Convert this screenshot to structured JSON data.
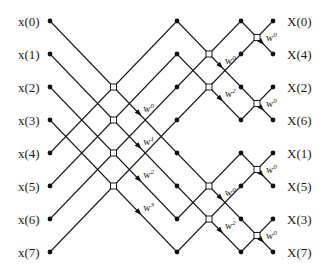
{
  "colors": {
    "line": "#1a1a1a",
    "node": "#111111",
    "background": "#ffffff"
  },
  "inputs": [
    "x(0)",
    "x(1)",
    "x(2)",
    "x(3)",
    "x(4)",
    "x(5)",
    "x(6)",
    "x(7)"
  ],
  "outputs": [
    "X(0)",
    "X(4)",
    "X(2)",
    "X(6)",
    "X(1)",
    "X(5)",
    "X(3)",
    "X(7)"
  ],
  "layout": {
    "row_y": [
      21,
      54,
      87,
      120,
      153,
      186,
      219,
      252
    ],
    "input_label_x": 18,
    "output_label_x": 287,
    "stage_x": [
      50,
      177,
      241,
      273
    ]
  },
  "stages": [
    {
      "name": "stage-1",
      "span": 4,
      "groups": [
        [
          0,
          4
        ],
        [
          1,
          5
        ],
        [
          2,
          6
        ],
        [
          3,
          7
        ]
      ],
      "twiddles": [
        {
          "base": "W",
          "exp": "0"
        },
        {
          "base": "W",
          "exp": "1"
        },
        {
          "base": "W",
          "exp": "2"
        },
        {
          "base": "W",
          "exp": "3"
        }
      ]
    },
    {
      "name": "stage-2",
      "span": 2,
      "groups": [
        [
          0,
          2
        ],
        [
          1,
          3
        ],
        [
          4,
          6
        ],
        [
          5,
          7
        ]
      ],
      "twiddles": [
        {
          "base": "W",
          "exp": "0"
        },
        {
          "base": "W",
          "exp": "2"
        },
        {
          "base": "W",
          "exp": "0"
        },
        {
          "base": "W",
          "exp": "2"
        }
      ]
    },
    {
      "name": "stage-3",
      "span": 1,
      "groups": [
        [
          0,
          1
        ],
        [
          2,
          3
        ],
        [
          4,
          5
        ],
        [
          6,
          7
        ]
      ],
      "twiddles": [
        {
          "base": "W",
          "exp": "0"
        },
        {
          "base": "W",
          "exp": "0"
        },
        {
          "base": "W",
          "exp": "0"
        },
        {
          "base": "W",
          "exp": "0"
        }
      ]
    }
  ]
}
